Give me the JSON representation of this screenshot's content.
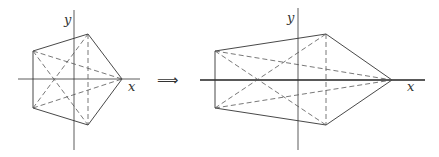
{
  "figure": {
    "left": {
      "axis_labels": {
        "x": "x",
        "y": "y"
      },
      "vertices": {
        "top": [
          88,
          34
        ],
        "left_top": [
          33,
          51
        ],
        "right": [
          122,
          79
        ],
        "left_bottom": [
          33,
          108
        ],
        "bottom": [
          88,
          125
        ]
      }
    },
    "arrow": "⟹",
    "right": {
      "axis_labels": {
        "x": "x",
        "y": "y"
      },
      "vertices": {
        "top": [
          326,
          34
        ],
        "left_top": [
          215,
          51
        ],
        "right": [
          392,
          80
        ],
        "left_bottom": [
          215,
          108
        ],
        "bottom": [
          326,
          125
        ]
      }
    }
  }
}
